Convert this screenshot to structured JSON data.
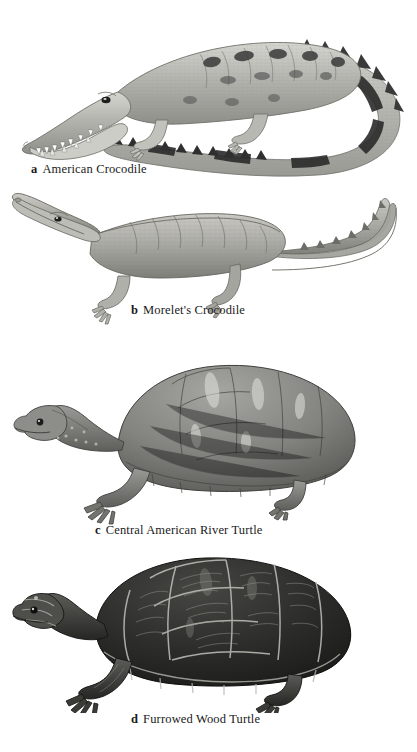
{
  "plate": {
    "background_color": "#ffffff",
    "style": "grayscale scientific field-guide illustration plate",
    "figures": [
      {
        "letter": "a",
        "label": "American Crocodile",
        "subject": "american-crocodile",
        "description": "Crocodile in lateral view facing left with narrow tapered snout, exposed teeth, dark dorsal blotches and banded tail curving around to the right",
        "body_tone": "#b9b9b4",
        "marking_tone": "#2e2e2e"
      },
      {
        "letter": "b",
        "label": "Morelet's Crocodile",
        "subject": "morelets-crocodile",
        "description": "Crocodile in lateral view facing left with broad blunt snout, uniform gray hide without dark blotches, tail curving upward at right",
        "body_tone": "#a9a9a4",
        "marking_tone": "#6b6b66"
      },
      {
        "letter": "c",
        "label": "Central American River Turtle",
        "subject": "central-american-river-turtle",
        "description": "Turtle in lateral view facing left with smooth high-domed gray carapace, faint scute seams, flattened head and clawed limbs",
        "body_tone": "#8d8d89",
        "marking_tone": "#4a4a47"
      },
      {
        "letter": "d",
        "label": "Furrowed Wood Turtle",
        "subject": "furrowed-wood-turtle",
        "description": "Turtle in lateral view facing left with very dark nearly black carapace, deeply furrowed scutes outlined by pale seams and concentric growth rings",
        "body_tone": "#2a2a28",
        "marking_tone": "#cfcfc9"
      }
    ]
  }
}
